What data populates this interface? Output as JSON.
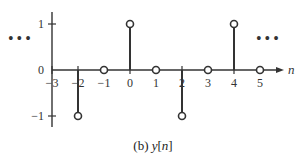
{
  "chart_data": {
    "type": "stem",
    "title": "",
    "caption_prefix": "(b)",
    "caption_signal": "y",
    "caption_index": "n",
    "xlabel": "n",
    "ylabel": "",
    "x": [
      -3,
      -2,
      -1,
      0,
      1,
      2,
      3,
      4,
      5
    ],
    "values": [
      null,
      -1,
      0,
      1,
      0,
      -1,
      0,
      1,
      0
    ],
    "x_ticks": [
      "-3",
      "-2",
      "-1",
      "0",
      "1",
      "2",
      "3",
      "4",
      "5"
    ],
    "y_ticks": [
      "-1",
      "0",
      "1"
    ],
    "ylim": [
      -1.2,
      1.3
    ],
    "continuation": "...",
    "marker": "open-circle",
    "grid": false
  },
  "colors": {
    "ink": "#333333",
    "background": "#ffffff"
  }
}
